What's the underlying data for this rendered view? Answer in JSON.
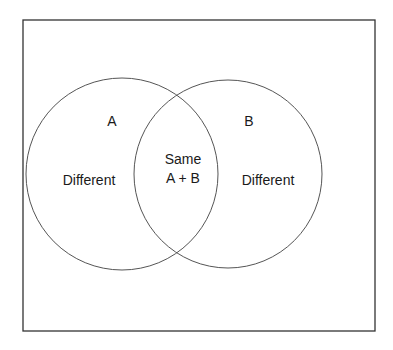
{
  "diagram": {
    "type": "venn",
    "colors": {
      "stroke": "#333333",
      "frame": "#333333",
      "text": "#1a1a1a",
      "background": "#ffffff"
    },
    "sets": [
      {
        "name": "A",
        "region_label": "Different"
      },
      {
        "name": "B",
        "region_label": "Different"
      }
    ],
    "intersection": {
      "line1": "Same",
      "line2": "A + B"
    }
  }
}
